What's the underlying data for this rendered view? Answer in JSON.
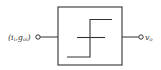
{
  "diagram": {
    "input": {
      "label_main": "(i",
      "label_sub1": "i",
      "label_mid": ",g",
      "label_sub2": "oi",
      "label_close": ")"
    },
    "output": {
      "label_main": "v",
      "label_sub": "o"
    },
    "block": {
      "type": "step-transfer-characteristic",
      "description": "comparator / Schmitt-like step function"
    },
    "colors": {
      "stroke": "#333333",
      "background": "#ffffff"
    }
  }
}
